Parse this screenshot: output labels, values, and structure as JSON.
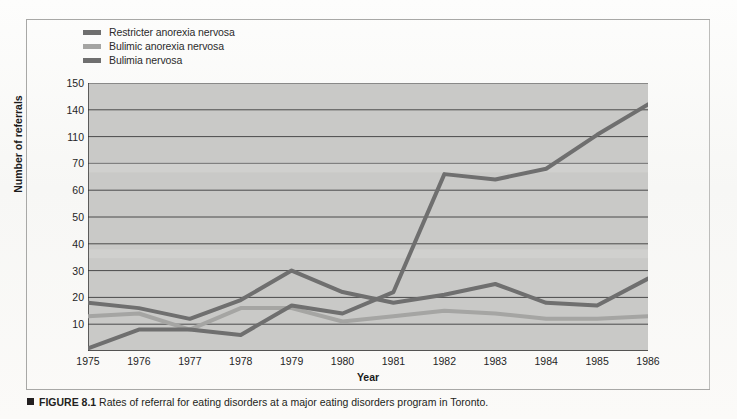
{
  "figure": {
    "number_label": "FIGURE 8.1",
    "caption_text": "Rates of referral for eating disorders at a major eating disorders program in Toronto.",
    "marker_icon": "square-bullet-icon"
  },
  "legend": {
    "items": [
      {
        "label": "Restricter anorexia nervosa",
        "color": "#6f6f6f"
      },
      {
        "label": "Bulimic anorexia nervosa",
        "color": "#a5a5a3"
      },
      {
        "label": "Bulimia nervosa",
        "color": "#6f6f6f"
      }
    ]
  },
  "chart_data": {
    "type": "line",
    "title": "",
    "xlabel": "Year",
    "ylabel": "Number of referrals",
    "x": [
      1975,
      1976,
      1977,
      1978,
      1979,
      1980,
      1981,
      1982,
      1983,
      1984,
      1985,
      1986
    ],
    "categories": [
      "1975",
      "1976",
      "1977",
      "1978",
      "1979",
      "1980",
      "1981",
      "1982",
      "1983",
      "1984",
      "1985",
      "1986"
    ],
    "yticks": [
      10,
      20,
      30,
      40,
      50,
      60,
      70,
      110,
      140,
      150
    ],
    "ylim": [
      0,
      150
    ],
    "grid": true,
    "legend_position": "above-plot-left",
    "plot_background": "#c9c9c7",
    "series": [
      {
        "name": "Restricter anorexia nervosa",
        "color": "#6f6f6f",
        "values": [
          18,
          16,
          12,
          19,
          30,
          22,
          18,
          21,
          25,
          18,
          17,
          27
        ]
      },
      {
        "name": "Bulimic anorexia nervosa",
        "color": "#a5a5a3",
        "values": [
          13,
          14,
          8,
          16,
          16,
          11,
          13,
          15,
          14,
          12,
          12,
          13
        ]
      },
      {
        "name": "Bulimia nervosa",
        "color": "#6f6f6f",
        "values": [
          1,
          8,
          8,
          6,
          17,
          14,
          22,
          66,
          64,
          68,
          112,
          142
        ]
      }
    ]
  }
}
